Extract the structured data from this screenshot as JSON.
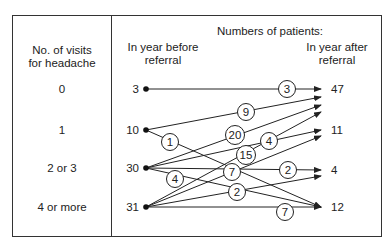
{
  "header": {
    "title": "Numbers of patients:",
    "before_line1": "In year before",
    "before_line2": "referral",
    "after_line1": "In year after",
    "after_line2": "referral",
    "visits_line1": "No. of visits",
    "visits_line2": "for headache"
  },
  "rows": [
    {
      "visits": "0",
      "before": "3",
      "after": "47"
    },
    {
      "visits": "1",
      "before": "10",
      "after": "11"
    },
    {
      "visits": "2 or 3",
      "before": "30",
      "after": "4"
    },
    {
      "visits": "4 or more",
      "before": "31",
      "after": "12"
    }
  ],
  "flows": [
    {
      "from": "0",
      "to": "0",
      "count": "3"
    },
    {
      "from": "1",
      "to": "0",
      "count": "9"
    },
    {
      "from": "1",
      "to": "3",
      "count": "1"
    },
    {
      "from": "2",
      "to": "0",
      "count": "20"
    },
    {
      "from": "2",
      "to": "1",
      "count": "4"
    },
    {
      "from": "2",
      "to": "2",
      "count": "2"
    },
    {
      "from": "2",
      "to": "3",
      "count": "4"
    },
    {
      "from": "3",
      "to": "0",
      "count": "15"
    },
    {
      "from": "3",
      "to": "1",
      "count": "7"
    },
    {
      "from": "3",
      "to": "2",
      "count": "2"
    },
    {
      "from": "3",
      "to": "3",
      "count": "7"
    }
  ]
}
